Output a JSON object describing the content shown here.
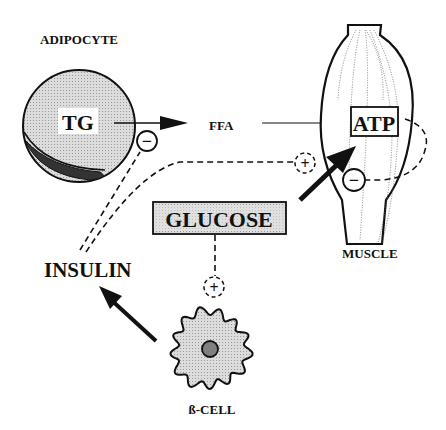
{
  "labels": {
    "adipocyte": "ADIPOCYTE",
    "tg": "TG",
    "ffa": "FFA",
    "atp": "ATP",
    "muscle": "MUSCLE",
    "glucose": "GLUCOSE",
    "insulin": "INSULIN",
    "beta_cell": "ß-CELL"
  },
  "signs": {
    "inhibit_lipolysis": "−",
    "stimulate_glucose_uptake": "+",
    "inhibit_glucose_oxidation": "−",
    "stimulate_insulin_secretion": "+"
  },
  "colors": {
    "cell_fill": "#d4d4d4",
    "nucleus_fill": "#808080",
    "glucose_box_fill": "#d9d9d9",
    "stroke": "#111111"
  }
}
